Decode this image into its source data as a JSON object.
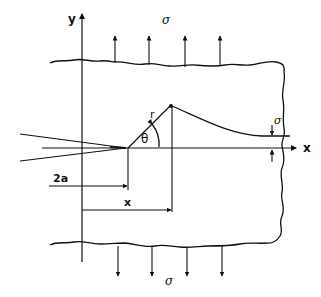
{
  "diagram": {
    "colors": {
      "line": "#111111",
      "background": "#ffffff"
    },
    "labels": {
      "y_axis": "y",
      "x_axis": "x",
      "sigma_top": "σ",
      "sigma_bottom": "σ",
      "sigma_right": "σ",
      "r": "r",
      "theta": "θ",
      "crack_length": "2a",
      "distance_x": "x"
    },
    "elements": [
      "plate-with-wavy-boundary",
      "y-axis-arrow",
      "x-axis-arrow",
      "crack-wedge",
      "polar-radius-r",
      "angle-theta-arc",
      "stress-distribution-curve",
      "top-tension-arrows",
      "bottom-tension-arrows",
      "right-stress-markers",
      "dimension-2a",
      "dimension-x"
    ]
  }
}
